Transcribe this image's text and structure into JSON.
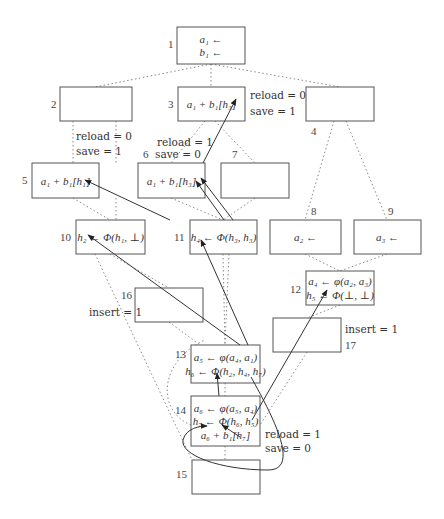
{
  "diagram": {
    "nodes": [
      {
        "id": "1",
        "x": 177,
        "y": 27,
        "w": 68,
        "h": 37,
        "lines": [
          "a₁ ←",
          "b₁ ←"
        ],
        "label": "1",
        "lx": 168,
        "ly": 48
      },
      {
        "id": "2",
        "x": 60,
        "y": 87,
        "w": 72,
        "h": 34,
        "lines": [],
        "label": "2",
        "lx": 51,
        "ly": 108
      },
      {
        "id": "3",
        "x": 178,
        "y": 87,
        "w": 67,
        "h": 34,
        "lines": [
          "a₁ + b₁[h₃]"
        ],
        "label": "3",
        "lx": 168,
        "ly": 108
      },
      {
        "id": "4",
        "x": 306,
        "y": 87,
        "w": 68,
        "h": 34,
        "lines": [],
        "label": "4",
        "lx": 311,
        "ly": 135
      },
      {
        "id": "5",
        "x": 32,
        "y": 163,
        "w": 67,
        "h": 35,
        "lines": [
          "a₁ + b₁[h₁]"
        ],
        "label": "5",
        "lx": 22,
        "ly": 184
      },
      {
        "id": "6",
        "x": 138,
        "y": 163,
        "w": 67,
        "h": 35,
        "lines": [
          "a₁ + b₁[h₃]"
        ],
        "label": "6",
        "lx": 143,
        "ly": 158
      },
      {
        "id": "7",
        "x": 221,
        "y": 163,
        "w": 68,
        "h": 35,
        "lines": [],
        "label": "7",
        "lx": 232,
        "ly": 158
      },
      {
        "id": "8",
        "x": 270,
        "y": 220,
        "w": 71,
        "h": 34,
        "lines": [
          "a₂ ←"
        ],
        "label": "8",
        "lx": 311,
        "ly": 215
      },
      {
        "id": "9",
        "x": 354,
        "y": 220,
        "w": 67,
        "h": 34,
        "lines": [
          "a₃ ←"
        ],
        "label": "9",
        "lx": 388,
        "ly": 215
      },
      {
        "id": "10",
        "x": 76,
        "y": 220,
        "w": 69,
        "h": 34,
        "lines": [
          "h₂ ← Φ(h₁, ⊥)"
        ],
        "label": "10",
        "lx": 60,
        "ly": 241
      },
      {
        "id": "11",
        "x": 190,
        "y": 220,
        "w": 67,
        "h": 34,
        "lines": [
          "h₄ ← Φ(h₃, h₃)"
        ],
        "label": "11",
        "lx": 174,
        "ly": 241
      },
      {
        "id": "12",
        "x": 306,
        "y": 271,
        "w": 68,
        "h": 34,
        "lines": [
          "a₄ ← φ(a₂, a₃)",
          "h₅ ← Φ(⊥, ⊥)"
        ],
        "label": "12",
        "lx": 290,
        "ly": 293
      },
      {
        "id": "13",
        "x": 191,
        "y": 345,
        "w": 69,
        "h": 38,
        "lines": [
          "a₅ ← φ(a₄, a₁)",
          "h₆ ← Φ(h₂, h₄, h₇)"
        ],
        "label": "13",
        "lx": 175,
        "ly": 358
      },
      {
        "id": "14",
        "x": 191,
        "y": 396,
        "w": 69,
        "h": 50,
        "lines": [
          "a₆ ← φ(a₅, a₄)",
          "h₇ ← Φ(h₆, h₅)",
          "a₆ + b₁[h₇]"
        ],
        "label": "14",
        "lx": 175,
        "ly": 414
      },
      {
        "id": "15",
        "x": 192,
        "y": 460,
        "w": 68,
        "h": 34,
        "lines": [],
        "label": "15",
        "lx": 176,
        "ly": 478
      },
      {
        "id": "16",
        "x": 135,
        "y": 288,
        "w": 68,
        "h": 34,
        "lines": [],
        "label": "16",
        "lx": 121,
        "ly": 299
      },
      {
        "id": "17",
        "x": 273,
        "y": 318,
        "w": 68,
        "h": 34,
        "lines": [],
        "label": "17",
        "lx": 345,
        "ly": 349
      }
    ],
    "annotations": [
      {
        "text": "reload = 0",
        "x": 250,
        "y": 99
      },
      {
        "text": "save = 1",
        "x": 250,
        "y": 115
      },
      {
        "text": "reload = 0",
        "x": 76,
        "y": 140
      },
      {
        "text": "save = 1",
        "x": 76,
        "y": 155
      },
      {
        "text": "reload = 1",
        "x": 157,
        "y": 146
      },
      {
        "text": "save = 0",
        "x": 155,
        "y": 158
      },
      {
        "text": "insert = 1",
        "x": 89,
        "y": 316
      },
      {
        "text": "insert = 1",
        "x": 345,
        "y": 333
      },
      {
        "text": "reload = 1",
        "x": 265,
        "y": 438
      },
      {
        "text": "save = 0",
        "x": 265,
        "y": 452
      }
    ],
    "dotted_edges": [
      [
        211,
        64,
        95,
        87
      ],
      [
        211,
        64,
        211,
        87
      ],
      [
        211,
        64,
        340,
        87
      ],
      [
        73,
        121,
        73,
        163
      ],
      [
        116,
        121,
        116,
        163
      ],
      [
        205,
        121,
        171,
        163
      ],
      [
        215,
        121,
        255,
        163
      ],
      [
        334,
        121,
        305,
        220
      ],
      [
        346,
        121,
        387,
        220
      ],
      [
        171,
        198,
        223,
        220
      ],
      [
        255,
        198,
        223,
        220
      ],
      [
        116,
        198,
        116,
        220
      ],
      [
        73,
        198,
        110,
        220
      ],
      [
        305,
        254,
        340,
        271
      ],
      [
        387,
        254,
        340,
        271
      ],
      [
        110,
        254,
        169,
        288
      ],
      [
        95,
        254,
        192,
        460
      ],
      [
        223,
        254,
        225,
        345
      ],
      [
        229,
        254,
        225,
        345
      ],
      [
        169,
        322,
        200,
        345
      ],
      [
        340,
        305,
        307,
        318
      ],
      [
        307,
        352,
        260,
        425
      ],
      [
        225,
        383,
        225,
        396
      ],
      [
        225,
        446,
        225,
        460
      ]
    ],
    "arrows": [
      {
        "from": [
          170,
          220
        ],
        "to": [
          85,
          180
        ]
      },
      {
        "from": [
          203,
          163
        ],
        "to": [
          236,
          99
        ]
      },
      {
        "from": [
          224,
          220
        ],
        "to": [
          196,
          181
        ]
      },
      {
        "from": [
          233,
          220
        ],
        "to": [
          201,
          178
        ]
      },
      {
        "from": [
          240,
          345
        ],
        "to": [
          88,
          235
        ]
      },
      {
        "from": [
          248,
          345
        ],
        "to": [
          201,
          240
        ]
      },
      {
        "from": [
          252,
          420
        ],
        "to": [
          327,
          290
        ]
      },
      {
        "from": [
          219,
          396
        ],
        "to": [
          217,
          373
        ]
      },
      {
        "from": [
          240,
          437
        ],
        "to": [
          222,
          425
        ]
      }
    ],
    "loop_label": "h₇ self-dependency",
    "loop_path": "M 251 377 C 275 420, 300 470, 268 470 C 220 470, 180 455, 183 440 C 186 428, 200 426, 207 426"
  }
}
